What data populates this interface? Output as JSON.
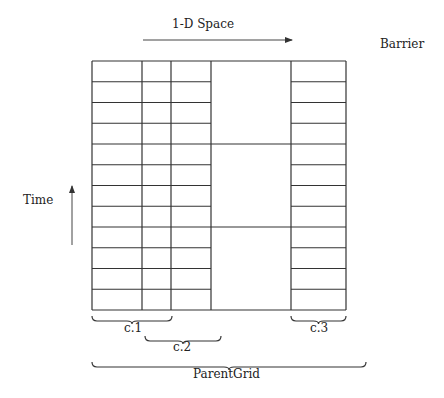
{
  "labels": {
    "space_axis": "1-D Space",
    "barrier": "Barrier",
    "time_axis": "Time",
    "c1": "c.1",
    "c2": "c.2",
    "c3": "c.3",
    "parent": "ParentGrid"
  },
  "grid": {
    "left": 92,
    "right": 346,
    "top": 61,
    "bottom": 310,
    "fine_rows": 12,
    "coarse_rows": 3,
    "vertical_lines": [
      92,
      142,
      171,
      211,
      291,
      346
    ],
    "fine_regions": [
      [
        92,
        211
      ],
      [
        291,
        346
      ]
    ],
    "coarse_region": [
      211,
      291
    ],
    "line_color": "#333333"
  },
  "braces": [
    {
      "name": "c1",
      "x1": 92,
      "x2": 172,
      "y": 316
    },
    {
      "name": "c2",
      "x1": 145,
      "x2": 221,
      "y": 336
    },
    {
      "name": "c3",
      "x1": 291,
      "x2": 346,
      "y": 316
    },
    {
      "name": "parent",
      "x1": 92,
      "x2": 366,
      "y": 362
    }
  ]
}
